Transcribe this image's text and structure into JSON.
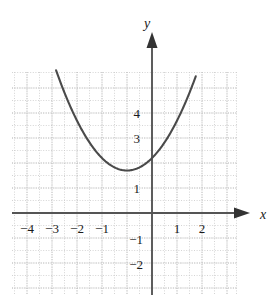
{
  "figure": {
    "caption_fragment": "",
    "axis_labels": {
      "x": "x",
      "y": "y"
    },
    "x_tick_labels": [
      "−4",
      "−3",
      "−2",
      "−1",
      "1",
      "2"
    ],
    "y_tick_labels": [
      "4",
      "3",
      "1",
      "−1",
      "−2"
    ],
    "colors": {
      "curve": "#4a4a4a",
      "axis": "#555555",
      "grid": "#c9c9c9",
      "text": "#1a1a1a",
      "background": "#ffffff"
    }
  },
  "chart_data": {
    "type": "line",
    "title": "",
    "xlabel": "x",
    "ylabel": "y",
    "xlim": [
      -5.6,
      3.4
    ],
    "ylim": [
      -3.3,
      6.1
    ],
    "grid": true,
    "grid_step": 0.5,
    "legend": null,
    "xticks": [
      -4,
      -3,
      -2,
      -1,
      1,
      2
    ],
    "xtick_labels": [
      "−4",
      "−3",
      "−2",
      "−1",
      "1",
      "2"
    ],
    "yticks": [
      4,
      3,
      1,
      -1,
      -2
    ],
    "ytick_labels": [
      "4",
      "3",
      "1",
      "−1",
      "−2"
    ],
    "series": [
      {
        "name": "parabola",
        "equation": "y = 0.5(x + 1)^2 + 1.7",
        "vertex": [
          -1,
          1.7
        ],
        "x": [
          -4.2,
          -4.0,
          -3.5,
          -3.0,
          -2.5,
          -2.0,
          -1.5,
          -1.0,
          -0.5,
          0.0,
          0.5,
          1.0,
          1.5,
          1.75
        ],
        "y": [
          6.8,
          6.2,
          4.8,
          3.7,
          2.8,
          2.2,
          1.825,
          1.7,
          1.825,
          2.2,
          2.825,
          3.7,
          4.825,
          5.48
        ]
      }
    ]
  }
}
